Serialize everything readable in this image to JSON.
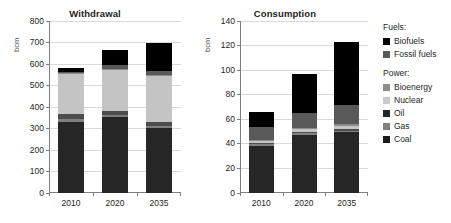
{
  "figure": {
    "width": 451,
    "height": 223,
    "background": "#ffffff"
  },
  "legend": {
    "groups": [
      {
        "title": "Fuels:",
        "items": [
          {
            "label": "Biofuels",
            "color": "#000000",
            "key": "biofuels"
          },
          {
            "label": "Fossil fuels",
            "color": "#595959",
            "key": "fossil_fuels"
          }
        ]
      },
      {
        "title": "Power:",
        "items": [
          {
            "label": "Bioenergy",
            "color": "#8c8c8c",
            "key": "bioenergy"
          },
          {
            "label": "Nuclear",
            "color": "#c9c9c9",
            "key": "nuclear"
          },
          {
            "label": "Oil",
            "color": "#262626",
            "key": "oil"
          },
          {
            "label": "Gas",
            "color": "#808080",
            "key": "gas"
          },
          {
            "label": "Coal",
            "color": "#1a1a1a",
            "key": "coal"
          }
        ]
      }
    ]
  },
  "chart_data": [
    {
      "type": "bar",
      "id": "withdrawal",
      "title": "Withdrawal",
      "xlabel": "",
      "ylabel": "bcm",
      "categories": [
        "2010",
        "2020",
        "2035"
      ],
      "ylim": [
        0,
        800
      ],
      "yticks": [
        0,
        100,
        200,
        300,
        400,
        500,
        600,
        700,
        800
      ],
      "grid": true,
      "stacked": true,
      "legend_position": "right-outside",
      "series": [
        {
          "name": "Coal",
          "color": "#262626",
          "values": [
            330,
            352,
            302
          ]
        },
        {
          "name": "Gas",
          "color": "#808080",
          "values": [
            14,
            11,
            11
          ]
        },
        {
          "name": "Oil",
          "color": "#4d4d4d",
          "values": [
            22,
            19,
            19
          ]
        },
        {
          "name": "Nuclear",
          "color": "#c4c4c4",
          "values": [
            188,
            190,
            210
          ]
        },
        {
          "name": "Bioenergy",
          "color": "#8c8c8c",
          "values": [
            3,
            4,
            5
          ]
        },
        {
          "name": "Fossil fuels",
          "color": "#595959",
          "values": [
            7,
            18,
            22
          ]
        },
        {
          "name": "Biofuels",
          "color": "#000000",
          "values": [
            16,
            73,
            130
          ]
        }
      ],
      "totals": [
        580,
        667,
        699
      ]
    },
    {
      "type": "bar",
      "id": "consumption",
      "title": "Consumption",
      "xlabel": "",
      "ylabel": "bcm",
      "categories": [
        "2010",
        "2020",
        "2035"
      ],
      "ylim": [
        0,
        140
      ],
      "yticks": [
        0,
        20,
        40,
        60,
        80,
        100,
        120,
        140
      ],
      "grid": true,
      "stacked": true,
      "legend_position": "right-outside",
      "series": [
        {
          "name": "Coal",
          "color": "#262626",
          "values": [
            38.5,
            47.5,
            49.5
          ]
        },
        {
          "name": "Gas",
          "color": "#808080",
          "values": [
            1.0,
            1.2,
            1.3
          ]
        },
        {
          "name": "Oil",
          "color": "#4d4d4d",
          "values": [
            1.2,
            1.3,
            1.4
          ]
        },
        {
          "name": "Nuclear",
          "color": "#c4c4c4",
          "values": [
            1.8,
            2.0,
            2.3
          ]
        },
        {
          "name": "Bioenergy",
          "color": "#8c8c8c",
          "values": [
            1.0,
            1.2,
            1.5
          ]
        },
        {
          "name": "Fossil fuels",
          "color": "#595959",
          "values": [
            10.5,
            11.8,
            16.0
          ]
        },
        {
          "name": "Biofuels",
          "color": "#000000",
          "values": [
            12.0,
            32.0,
            51.0
          ]
        }
      ],
      "totals": [
        66,
        97,
        123
      ]
    }
  ]
}
